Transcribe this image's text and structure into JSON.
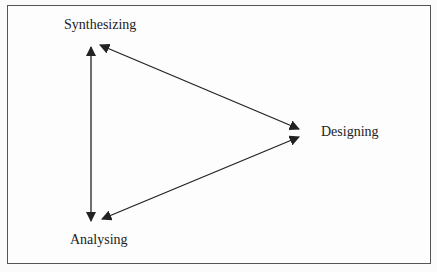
{
  "diagram": {
    "type": "cycle-triangle",
    "nodes": [
      {
        "id": "synthesizing",
        "label": "Synthesizing"
      },
      {
        "id": "designing",
        "label": "Designing"
      },
      {
        "id": "analysing",
        "label": "Analysing"
      }
    ],
    "edges": [
      {
        "from": "synthesizing",
        "to": "analysing",
        "bidirectional": true
      },
      {
        "from": "synthesizing",
        "to": "designing",
        "bidirectional": true
      },
      {
        "from": "analysing",
        "to": "designing",
        "bidirectional": true
      }
    ],
    "colors": {
      "line": "#222222",
      "border": "#555555",
      "background": "#fdfdfd"
    }
  }
}
